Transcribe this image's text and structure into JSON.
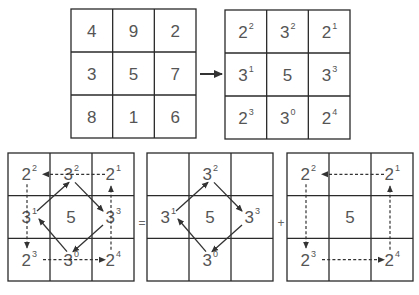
{
  "diagram": {
    "magic_square": {
      "cells": [
        [
          "4",
          "9",
          "2"
        ],
        [
          "3",
          "5",
          "7"
        ],
        [
          "8",
          "1",
          "6"
        ]
      ]
    },
    "transform_arrow": "right-arrow",
    "power_square": {
      "cells": [
        [
          {
            "base": "2",
            "exp": "2"
          },
          {
            "base": "3",
            "exp": "2"
          },
          {
            "base": "2",
            "exp": "1"
          }
        ],
        [
          {
            "base": "3",
            "exp": "1"
          },
          {
            "base": "5",
            "exp": ""
          },
          {
            "base": "3",
            "exp": "3"
          }
        ],
        [
          {
            "base": "2",
            "exp": "3"
          },
          {
            "base": "3",
            "exp": "0"
          },
          {
            "base": "2",
            "exp": "4"
          }
        ]
      ]
    },
    "combined_square": {
      "cells": [
        [
          {
            "base": "2",
            "exp": "2"
          },
          {
            "base": "3",
            "exp": "2"
          },
          {
            "base": "2",
            "exp": "1"
          }
        ],
        [
          {
            "base": "3",
            "exp": "1"
          },
          {
            "base": "5",
            "exp": ""
          },
          {
            "base": "3",
            "exp": "3"
          }
        ],
        [
          {
            "base": "2",
            "exp": "3"
          },
          {
            "base": "3",
            "exp": "0"
          },
          {
            "base": "2",
            "exp": "4"
          }
        ]
      ],
      "solid_cycle": [
        "3^1",
        "3^2",
        "3^3",
        "3^0",
        "3^1"
      ],
      "dashed_cycle": [
        "2^1",
        "2^2",
        "2^3",
        "2^4",
        "2^1"
      ]
    },
    "equals_sign": "=",
    "powers_of_3_square": {
      "cells": [
        [
          {
            "base": "",
            "exp": ""
          },
          {
            "base": "3",
            "exp": "2"
          },
          {
            "base": "",
            "exp": ""
          }
        ],
        [
          {
            "base": "3",
            "exp": "1"
          },
          {
            "base": "5",
            "exp": ""
          },
          {
            "base": "3",
            "exp": "3"
          }
        ],
        [
          {
            "base": "",
            "exp": ""
          },
          {
            "base": "3",
            "exp": "0"
          },
          {
            "base": "",
            "exp": ""
          }
        ]
      ],
      "solid_cycle": [
        "3^1",
        "3^2",
        "3^3",
        "3^0",
        "3^1"
      ]
    },
    "plus_sign": "+",
    "powers_of_2_square": {
      "cells": [
        [
          {
            "base": "2",
            "exp": "2"
          },
          {
            "base": "",
            "exp": ""
          },
          {
            "base": "2",
            "exp": "1"
          }
        ],
        [
          {
            "base": "",
            "exp": ""
          },
          {
            "base": "5",
            "exp": ""
          },
          {
            "base": "",
            "exp": ""
          }
        ],
        [
          {
            "base": "2",
            "exp": "3"
          },
          {
            "base": "",
            "exp": ""
          },
          {
            "base": "2",
            "exp": "4"
          }
        ]
      ],
      "dashed_cycle": [
        "2^1",
        "2^2",
        "2^3",
        "2^4",
        "2^1"
      ]
    },
    "colors": {
      "line": "#2a2a2a",
      "text": "#555555"
    }
  }
}
